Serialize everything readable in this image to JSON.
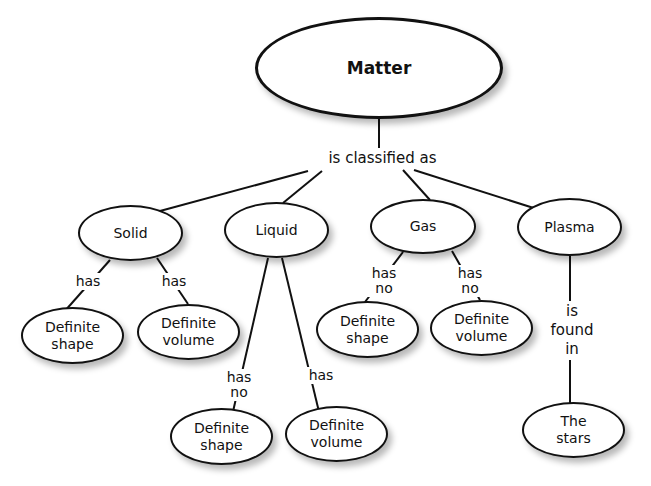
{
  "title": "Matter",
  "root": {
    "label": "Matter"
  },
  "root_link": "is classified as",
  "states": [
    {
      "label": "Solid"
    },
    {
      "label": "Liquid"
    },
    {
      "label": "Gas"
    },
    {
      "label": "Plasma"
    }
  ],
  "leaves": [
    {
      "label": "Definite\nshape"
    },
    {
      "label": "Definite\nvolume"
    },
    {
      "label": "Definite\nshape"
    },
    {
      "label": "Definite\nvolume"
    },
    {
      "label": "Definite\nshape"
    },
    {
      "label": "Definite\nvolume"
    },
    {
      "label": "The\nstars"
    }
  ],
  "links": [
    {
      "label": "has"
    },
    {
      "label": "has"
    },
    {
      "label": "has\nno"
    },
    {
      "label": "has"
    },
    {
      "label": "has\nno"
    },
    {
      "label": "has\nno"
    },
    {
      "label": "is\nfound\nin"
    }
  ]
}
